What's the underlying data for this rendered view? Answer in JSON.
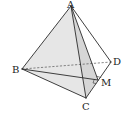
{
  "diagram": {
    "type": "tetrahedron",
    "vertices": {
      "A": {
        "label": "A",
        "x": 71,
        "y": 6
      },
      "B": {
        "label": "B",
        "x": 22,
        "y": 69
      },
      "C": {
        "label": "C",
        "x": 86,
        "y": 98
      },
      "D": {
        "label": "D",
        "x": 111,
        "y": 62
      },
      "M": {
        "label": "M",
        "x": 98,
        "y": 80
      }
    },
    "labels": {
      "A": "A",
      "B": "B",
      "C": "C",
      "D": "D",
      "M": "M"
    },
    "solid_edges": [
      "AB",
      "AC",
      "AD",
      "BC",
      "CD",
      "AM",
      "BM"
    ],
    "dashed_edges": [
      "BD"
    ],
    "shaded_faces": [
      "ABC",
      "ACM"
    ],
    "right_angle_marks": [
      "AMD",
      "BMC"
    ],
    "colors": {
      "line": "#2a2a2a",
      "shade": "#e6e6e6",
      "background": "#ffffff"
    }
  }
}
